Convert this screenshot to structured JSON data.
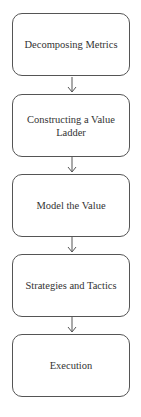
{
  "diagram": {
    "type": "flowchart",
    "direction": "top-to-bottom",
    "nodes": [
      {
        "id": "n1",
        "label": "Decomposing Metrics"
      },
      {
        "id": "n2",
        "label": "Constructing a Value Ladder"
      },
      {
        "id": "n3",
        "label": "Model the Value"
      },
      {
        "id": "n4",
        "label": "Strategies and Tactics"
      },
      {
        "id": "n5",
        "label": "Execution"
      }
    ],
    "edges": [
      {
        "from": "n1",
        "to": "n2"
      },
      {
        "from": "n2",
        "to": "n3"
      },
      {
        "from": "n3",
        "to": "n4"
      },
      {
        "from": "n4",
        "to": "n5"
      }
    ],
    "colors": {
      "border": "#555555",
      "text": "#333333",
      "background": "#ffffff"
    }
  }
}
